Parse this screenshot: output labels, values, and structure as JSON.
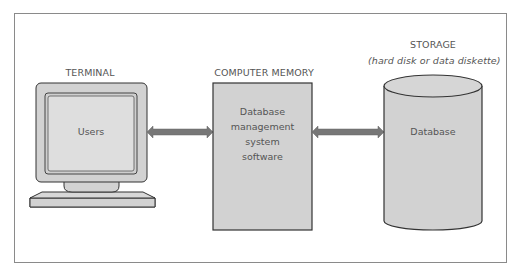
{
  "diagram": {
    "type": "block-diagram",
    "colors": {
      "fill_gray": "#d2d2d2",
      "screen_fill": "#dedede",
      "outline": "#333333",
      "arrow": "#777777",
      "frame_border": "#8a8a8a",
      "text": "#555555"
    },
    "nodes": [
      {
        "id": "terminal",
        "label": "TERMINAL",
        "shape": "computer-monitor",
        "inner_text": "Users"
      },
      {
        "id": "computer-memory",
        "label": "COMPUTER MEMORY",
        "shape": "rectangle",
        "inner_text_lines": [
          "Database",
          "management",
          "system",
          "software"
        ]
      },
      {
        "id": "storage",
        "label": "STORAGE",
        "sublabel": "(hard disk or data diskette)",
        "shape": "cylinder",
        "inner_text": "Database"
      }
    ],
    "edges": [
      {
        "from": "terminal",
        "to": "computer-memory",
        "style": "double-headed-arrow"
      },
      {
        "from": "computer-memory",
        "to": "storage",
        "style": "double-headed-arrow"
      }
    ]
  }
}
